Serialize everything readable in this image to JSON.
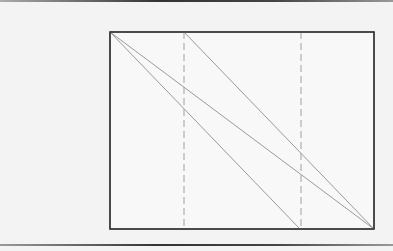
{
  "diagram": {
    "background": "#f3f3f3",
    "panel_fill": "#f8f8f8",
    "border_color": "#333333",
    "line_color": "#9a9a9a",
    "dashed_color": "#a0a0a0",
    "box": {
      "x": 110,
      "y": 32,
      "width": 264,
      "height": 197
    },
    "dashed_lines": [
      {
        "x": 184,
        "y1": 32,
        "y2": 229
      },
      {
        "x": 301,
        "y1": 32,
        "y2": 229
      }
    ],
    "diagonals": [
      {
        "x1": 110,
        "y1": 32,
        "x2": 374,
        "y2": 229
      },
      {
        "x1": 110,
        "y1": 32,
        "x2": 300,
        "y2": 229
      },
      {
        "x1": 184,
        "y1": 32,
        "x2": 374,
        "y2": 229
      }
    ]
  }
}
